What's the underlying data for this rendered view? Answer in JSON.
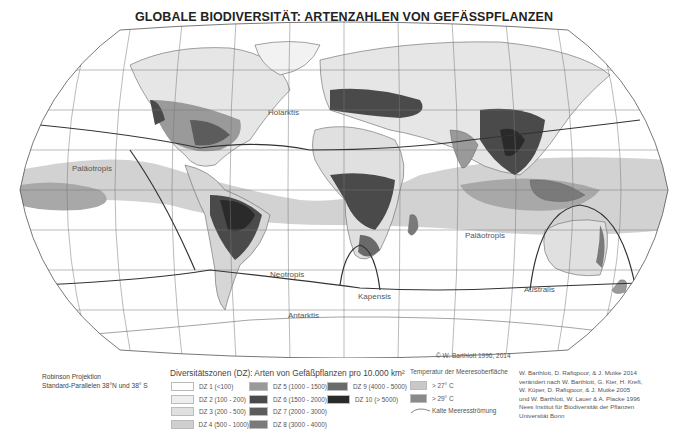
{
  "title": "GLOBALE BIODIVERSITÄT: ARTENZAHLEN VON GEFÄSSPFLANZEN",
  "map": {
    "region_labels": {
      "holarktis": "Holarktis",
      "palaeotropis_west": "Paläotropis",
      "palaeotropis_east": "Paläotropis",
      "neotropis": "Neotropis",
      "kapensis": "Kapensis",
      "antarktis": "Antarktis",
      "australis": "Australis"
    },
    "copyright": "© W. Barthlott 1996, 2014"
  },
  "projection": {
    "line1": "Robinson Projektion",
    "line2": "Standard-Parallelen 38°N und 38° S"
  },
  "legend": {
    "title": "Diversitätszonen (DZ): Arten von Gefäßpflanzen pro 10.000 km²",
    "items": [
      {
        "label": "DZ 1 (<100)",
        "color": "#ffffff"
      },
      {
        "label": "DZ 2 (100 - 200)",
        "color": "#eeeeee"
      },
      {
        "label": "DZ 3 (200 - 500)",
        "color": "#e0e0e0"
      },
      {
        "label": "DZ 4 (500 - 1000)",
        "color": "#cfcfcf"
      },
      {
        "label": "DZ 5 (1000 - 1500)",
        "color": "#9a9a9a"
      },
      {
        "label": "DZ 6 (1500 - 2000)",
        "color": "#4a4a4a"
      },
      {
        "label": "DZ 7 (2000 - 3000)",
        "color": "#5c5c5c"
      },
      {
        "label": "DZ 8 (3000 - 4000)",
        "color": "#7a7a7a"
      },
      {
        "label": "DZ 9 (4000 - 5000)",
        "color": "#6a6a6a"
      },
      {
        "label": "DZ 10 (> 5000)",
        "color": "#2a2a2a"
      }
    ]
  },
  "sea_temperature": {
    "title": "Temperatur der Meeresoberfläche",
    "items": [
      {
        "label": "> 27° C",
        "color": "#c8c8c8"
      },
      {
        "label": "> 29° C",
        "color": "#8a8a8a"
      }
    ],
    "current_label": "Kalte Meeresströmung"
  },
  "credits": [
    "W. Barthlott, D. Rafiqpoor, & J. Mutke 2014",
    "verändert nach W. Barthlott, G. Kier, H. Kreft,",
    "W. Küper, D. Rafiqpoor, & J. Mutke 2005",
    "und W. Barthlott, W. Lauer & A. Placke 1996",
    "Nees Institut für Biodiversität der Pflanzen",
    "Universität Bonn"
  ]
}
